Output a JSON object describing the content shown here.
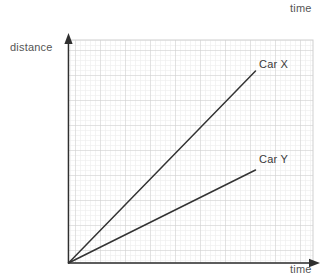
{
  "chart_data": {
    "type": "line",
    "title": "",
    "xlabel": "time",
    "ylabel": "distance",
    "grid": true,
    "grid_minor_step": 5,
    "grid_major_step": 25,
    "legend_position": "inline-at-line-end",
    "axis_arrows": true,
    "xlim": [
      0,
      49
    ],
    "ylim": [
      0,
      44.6
    ],
    "series": [
      {
        "name": "Car X",
        "label": "Car X",
        "color": "#333333",
        "x": [
          0,
          37.4
        ],
        "y": [
          0,
          38.4
        ]
      },
      {
        "name": "Car Y",
        "label": "Car Y",
        "color": "#333333",
        "x": [
          0,
          37.4
        ],
        "y": [
          0,
          18.6
        ]
      }
    ],
    "annotations": [
      {
        "text": "time",
        "position": "top-right"
      },
      {
        "text": "time",
        "position": "bottom-right"
      },
      {
        "text": "distance",
        "position": "top-left"
      }
    ]
  },
  "labels": {
    "time_top": "time",
    "time_bottom": "time",
    "distance": "distance",
    "car_x": "Car X",
    "car_y": "Car Y"
  },
  "colors": {
    "background": "#ffffff",
    "grid_minor": "#e9e9e9",
    "grid_major": "#cfcfcf",
    "axis": "#2f2f2f",
    "line": "#333333",
    "label_text": "#555555"
  }
}
